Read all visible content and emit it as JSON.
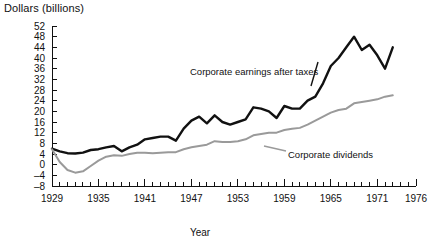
{
  "chart_data": {
    "type": "line",
    "title": "",
    "ylabel": "Dollars (billions)",
    "xlabel": "Year",
    "ylim": [
      -8,
      52
    ],
    "xlim": [
      1929,
      1976
    ],
    "ytick_step": 4,
    "xtick_step": 1,
    "xlabel_step": 6,
    "grid": false,
    "legend_position": "inline-annotations",
    "yticks": [
      -8,
      -4,
      0,
      4,
      8,
      12,
      16,
      20,
      24,
      28,
      32,
      36,
      40,
      44,
      48,
      52
    ],
    "xticks_labeled": [
      1929,
      1935,
      1941,
      1947,
      1953,
      1959,
      1965,
      1971,
      1976
    ],
    "series": [
      {
        "name": "Corporate earnings after taxes",
        "color": "#111111",
        "x": [
          1929,
          1930,
          1931,
          1932,
          1933,
          1934,
          1935,
          1936,
          1937,
          1938,
          1939,
          1940,
          1941,
          1942,
          1943,
          1944,
          1945,
          1946,
          1947,
          1948,
          1949,
          1950,
          1951,
          1952,
          1953,
          1954,
          1955,
          1956,
          1957,
          1958,
          1959,
          1960,
          1961,
          1962,
          1963,
          1964,
          1965,
          1966,
          1967,
          1968,
          1969,
          1970,
          1971,
          1972,
          1973
        ],
        "values": [
          6.0,
          5.0,
          4.3,
          4.2,
          4.5,
          5.5,
          5.8,
          6.5,
          7.0,
          5.0,
          6.5,
          7.5,
          9.5,
          10.0,
          10.5,
          10.5,
          9.0,
          13.5,
          16.5,
          18.0,
          15.5,
          18.5,
          16.0,
          15.0,
          16.0,
          17.0,
          21.5,
          21.0,
          20.0,
          17.5,
          22.0,
          21.0,
          21.0,
          24.0,
          25.5,
          30.5,
          37.0,
          40.0,
          44.0,
          48.0,
          43.0,
          45.0,
          41.0,
          36.0,
          44.0
        ]
      },
      {
        "name": "Corporate dividends",
        "color": "#9a9a9a",
        "x": [
          1929,
          1930,
          1931,
          1932,
          1933,
          1934,
          1935,
          1936,
          1937,
          1938,
          1939,
          1940,
          1941,
          1942,
          1943,
          1944,
          1945,
          1946,
          1947,
          1948,
          1949,
          1950,
          1951,
          1952,
          1953,
          1954,
          1955,
          1956,
          1957,
          1958,
          1959,
          1960,
          1961,
          1962,
          1963,
          1964,
          1965,
          1966,
          1967,
          1968,
          1969,
          1970,
          1971,
          1972,
          1973
        ],
        "values": [
          5.8,
          1.0,
          -2.0,
          -3.0,
          -2.5,
          -0.5,
          1.5,
          3.0,
          3.5,
          3.3,
          4.0,
          4.5,
          4.5,
          4.3,
          4.5,
          4.7,
          4.7,
          5.8,
          6.5,
          7.0,
          7.5,
          8.8,
          8.5,
          8.5,
          8.8,
          9.5,
          11.0,
          11.5,
          12.0,
          12.0,
          13.0,
          13.5,
          13.8,
          15.0,
          16.5,
          18.0,
          19.5,
          20.5,
          21.0,
          23.0,
          23.5,
          24.0,
          24.5,
          25.5,
          26.0
        ]
      }
    ],
    "annotations": [
      {
        "text": "Corporate earnings after taxes",
        "x": 190,
        "y": 75
      },
      {
        "text": "Corporate dividends",
        "x": 288,
        "y": 158
      }
    ]
  }
}
